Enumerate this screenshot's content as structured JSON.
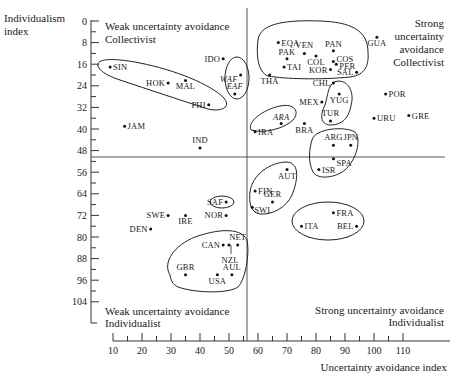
{
  "chart_data": {
    "type": "scatter",
    "title": "",
    "xlabel": "Uncertainty avoidance index",
    "ylabel": "Individualism index",
    "xlim": [
      10,
      120
    ],
    "ylim": [
      0,
      108
    ],
    "y_inverted": true,
    "x_ticks": [
      10,
      20,
      30,
      40,
      50,
      60,
      70,
      80,
      90,
      100,
      110
    ],
    "y_ticks": [
      0,
      8,
      16,
      24,
      32,
      40,
      48,
      56,
      64,
      72,
      80,
      88,
      96,
      104
    ],
    "grid": false,
    "divider_lines": {
      "x": 56.5,
      "y": 50
    },
    "quadrant_labels": {
      "top_left": [
        "Weak uncertainty avoidance",
        "Collectivist"
      ],
      "top_right": [
        "Strong",
        "uncertainty",
        "avoidance",
        "Collectivist"
      ],
      "bottom_left": [
        "Weak uncertainty avoidance",
        "Individualist"
      ],
      "bottom_right": [
        "Strong uncertainty avoidance",
        "Individualist"
      ]
    },
    "points": [
      {
        "label": "SIN",
        "x": 9,
        "y": 17
      },
      {
        "label": "HOK",
        "x": 29,
        "y": 23
      },
      {
        "label": "MAL",
        "x": 35,
        "y": 22
      },
      {
        "label": "PHI",
        "x": 43,
        "y": 31
      },
      {
        "label": "IDO",
        "x": 48,
        "y": 14
      },
      {
        "label": "WAF",
        "x": 54,
        "y": 20,
        "italic": true
      },
      {
        "label": "EAF",
        "x": 52,
        "y": 27,
        "italic": true
      },
      {
        "label": "JAM",
        "x": 14,
        "y": 39
      },
      {
        "label": "IND",
        "x": 40,
        "y": 47
      },
      {
        "label": "EQA",
        "x": 67,
        "y": 8
      },
      {
        "label": "VEN",
        "x": 76,
        "y": 12
      },
      {
        "label": "PAK",
        "x": 70,
        "y": 14
      },
      {
        "label": "COL",
        "x": 80,
        "y": 13
      },
      {
        "label": "PAN",
        "x": 86,
        "y": 11
      },
      {
        "label": "COS",
        "x": 86,
        "y": 15
      },
      {
        "label": "PER",
        "x": 87,
        "y": 16
      },
      {
        "label": "TAI",
        "x": 69,
        "y": 17
      },
      {
        "label": "KOR",
        "x": 85,
        "y": 18
      },
      {
        "label": "SAL",
        "x": 94,
        "y": 19
      },
      {
        "label": "THA",
        "x": 64,
        "y": 20
      },
      {
        "label": "CHL",
        "x": 86,
        "y": 23
      },
      {
        "label": "GUA",
        "x": 101,
        "y": 6
      },
      {
        "label": "MEX",
        "x": 82,
        "y": 30
      },
      {
        "label": "YUG",
        "x": 88,
        "y": 27
      },
      {
        "label": "POR",
        "x": 104,
        "y": 27
      },
      {
        "label": "TUR",
        "x": 85,
        "y": 37
      },
      {
        "label": "URU",
        "x": 100,
        "y": 36
      },
      {
        "label": "GRE",
        "x": 112,
        "y": 35
      },
      {
        "label": "ARA",
        "x": 68,
        "y": 38,
        "italic": true
      },
      {
        "label": "IRA",
        "x": 59,
        "y": 41
      },
      {
        "label": "BRA",
        "x": 76,
        "y": 38
      },
      {
        "label": "ARG",
        "x": 86,
        "y": 46
      },
      {
        "label": "JPN",
        "x": 92,
        "y": 46
      },
      {
        "label": "SPA",
        "x": 86,
        "y": 51
      },
      {
        "label": "ISR",
        "x": 81,
        "y": 55
      },
      {
        "label": "AUT",
        "x": 70,
        "y": 55
      },
      {
        "label": "FIN",
        "x": 59,
        "y": 63
      },
      {
        "label": "SWI",
        "x": 58,
        "y": 69
      },
      {
        "label": "GER",
        "x": 65,
        "y": 67
      },
      {
        "label": "FRA",
        "x": 86,
        "y": 71
      },
      {
        "label": "ITA",
        "x": 75,
        "y": 76
      },
      {
        "label": "BEL",
        "x": 94,
        "y": 76
      },
      {
        "label": "SAF",
        "x": 49,
        "y": 67
      },
      {
        "label": "NOR",
        "x": 49,
        "y": 72
      },
      {
        "label": "SWE",
        "x": 29,
        "y": 72
      },
      {
        "label": "IRE",
        "x": 35,
        "y": 72
      },
      {
        "label": "DEN",
        "x": 23,
        "y": 77
      },
      {
        "label": "CAN",
        "x": 48,
        "y": 83
      },
      {
        "label": "NZL",
        "x": 50,
        "y": 83
      },
      {
        "label": "NET",
        "x": 53,
        "y": 83
      },
      {
        "label": "GBR",
        "x": 35,
        "y": 94
      },
      {
        "label": "USA",
        "x": 46,
        "y": 94
      },
      {
        "label": "AUL",
        "x": 51,
        "y": 94
      }
    ],
    "clusters": [
      [
        "SIN",
        "HOK",
        "MAL",
        "PHI"
      ],
      [
        "WAF",
        "EAF"
      ],
      [
        "EQA",
        "VEN",
        "PAK",
        "COL",
        "PAN",
        "COS",
        "PER",
        "TAI",
        "KOR",
        "SAL",
        "THA",
        "CHL"
      ],
      [
        "YUG",
        "TUR"
      ],
      [
        "ARA",
        "IRA"
      ],
      [
        "ARG",
        "JPN",
        "SPA",
        "ISR"
      ],
      [
        "AUT",
        "FIN",
        "SWI",
        "GER"
      ],
      [
        "FRA",
        "ITA",
        "BEL"
      ],
      [
        "SAF"
      ],
      [
        "CAN",
        "NET",
        "NZL",
        "GBR",
        "USA",
        "AUL"
      ]
    ]
  }
}
